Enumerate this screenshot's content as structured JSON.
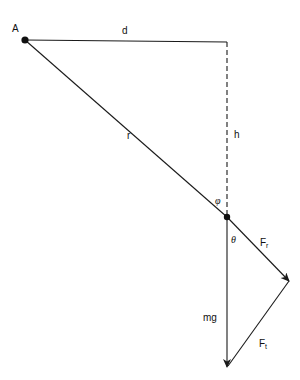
{
  "diagram": {
    "type": "free-body / pendulum force decomposition",
    "colors": {
      "line": "#1a1a1a",
      "background": "#ffffff"
    },
    "points": {
      "A": {
        "label": "A",
        "x": 25,
        "y": 40
      },
      "corner": {
        "x": 227,
        "y": 42
      },
      "pivot": {
        "x": 227,
        "y": 217
      },
      "fr_tip": {
        "x": 289,
        "y": 281
      },
      "mg_tip": {
        "x": 227,
        "y": 367
      }
    },
    "labels": {
      "A": "A",
      "d": "d",
      "r": "r",
      "h": "h",
      "phi": "φ",
      "theta": "θ",
      "mg": "mg",
      "Fr_main": "F",
      "Fr_sub": "r",
      "Ft_main": "F",
      "Ft_sub": "t"
    },
    "segments": [
      {
        "name": "d",
        "from": "A",
        "to": "corner",
        "style": "solid"
      },
      {
        "name": "h",
        "from": "corner",
        "to": "pivot",
        "style": "dashed"
      },
      {
        "name": "r",
        "from": "A",
        "to": "pivot",
        "style": "solid"
      },
      {
        "name": "F_r",
        "from": "pivot",
        "to": "fr_tip",
        "style": "arrow"
      },
      {
        "name": "mg",
        "from": "pivot",
        "to": "mg_tip",
        "style": "arrow"
      },
      {
        "name": "F_t",
        "from": "fr_tip",
        "to": "mg_tip",
        "style": "arrow"
      }
    ]
  }
}
